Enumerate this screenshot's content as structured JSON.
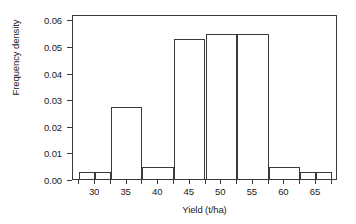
{
  "chart_data": {
    "type": "bar",
    "chart_subtype": "histogram",
    "title": "",
    "xlabel": "Yield (t/ha)",
    "ylabel": "Frequency density",
    "xlim": [
      26.5,
      68.5
    ],
    "ylim": [
      0.0,
      0.062
    ],
    "grid": false,
    "legend": null,
    "x_ticks": [
      30,
      35,
      40,
      45,
      50,
      55,
      60,
      65
    ],
    "x_tick_labels": [
      "30",
      "35",
      "40",
      "45",
      "50",
      "55",
      "60",
      "65"
    ],
    "x_minor_ticks": [
      27.5,
      32.5,
      37.5,
      42.5,
      47.5,
      52.5,
      57.5,
      62.5,
      67.5
    ],
    "y_ticks": [
      0.0,
      0.01,
      0.02,
      0.03,
      0.04,
      0.05,
      0.06
    ],
    "y_tick_labels": [
      "0.00",
      "0.01",
      "0.02",
      "0.03",
      "0.04",
      "0.05",
      "0.06"
    ],
    "bin_edges": [
      27.5,
      30.0,
      32.5,
      37.5,
      42.5,
      47.5,
      52.5,
      57.5,
      62.5,
      65.0,
      67.5
    ],
    "bars": [
      {
        "label": "27.5-30",
        "x0": 27.5,
        "x1": 30.0,
        "value": 0.0025
      },
      {
        "label": "30-32.5",
        "x0": 30.0,
        "x1": 32.5,
        "value": 0.0025
      },
      {
        "label": "32.5-37.5",
        "x0": 32.5,
        "x1": 37.5,
        "value": 0.027
      },
      {
        "label": "37.5-42.5",
        "x0": 37.5,
        "x1": 42.5,
        "value": 0.0045
      },
      {
        "label": "42.5-47.5",
        "x0": 42.5,
        "x1": 47.5,
        "value": 0.0525
      },
      {
        "label": "47.5-52.5",
        "x0": 47.5,
        "x1": 52.5,
        "value": 0.0545
      },
      {
        "label": "52.5-57.5",
        "x0": 52.5,
        "x1": 57.5,
        "value": 0.0545
      },
      {
        "label": "57.5-62.5",
        "x0": 57.5,
        "x1": 62.5,
        "value": 0.0045
      },
      {
        "label": "62.5-65",
        "x0": 62.5,
        "x1": 65.0,
        "value": 0.0025
      },
      {
        "label": "65-67.5",
        "x0": 65.0,
        "x1": 67.5,
        "value": 0.0025
      }
    ],
    "categories": [
      "27.5-30",
      "30-32.5",
      "32.5-37.5",
      "37.5-42.5",
      "42.5-47.5",
      "47.5-52.5",
      "52.5-57.5",
      "57.5-62.5",
      "62.5-65",
      "65-67.5"
    ],
    "values": [
      0.0025,
      0.0025,
      0.027,
      0.0045,
      0.0525,
      0.0545,
      0.0545,
      0.0045,
      0.0025,
      0.0025
    ],
    "colors": {
      "bar_edge": "#3a3a3a",
      "bar_fill": "transparent",
      "axis": "#3a3a3a",
      "text": "#1a1a1a",
      "background": "#ffffff"
    }
  }
}
